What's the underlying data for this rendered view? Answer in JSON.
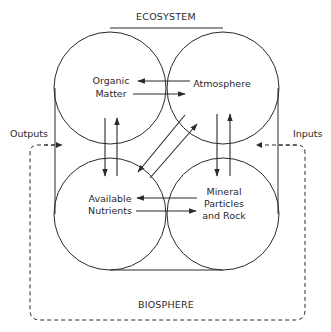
{
  "diagram": {
    "title_top": "ECOSYSTEM",
    "title_bottom": "BIOSPHERE",
    "outputs_label": "Outputs",
    "inputs_label": "Inputs",
    "nodes": [
      {
        "id": "organic-matter",
        "lines": [
          "Organic",
          "Matter"
        ]
      },
      {
        "id": "atmosphere",
        "lines": [
          "Atmosphere"
        ]
      },
      {
        "id": "available-nutrients",
        "lines": [
          "Available",
          "Nutrients"
        ]
      },
      {
        "id": "mineral-particles",
        "lines": [
          "Mineral",
          "Particles",
          "and  Rock"
        ]
      }
    ],
    "edges": [
      {
        "from": "atmosphere",
        "to": "organic-matter"
      },
      {
        "from": "organic-matter",
        "to": "atmosphere"
      },
      {
        "from": "mineral-particles",
        "to": "available-nutrients"
      },
      {
        "from": "available-nutrients",
        "to": "mineral-particles"
      },
      {
        "from": "organic-matter",
        "to": "available-nutrients"
      },
      {
        "from": "available-nutrients",
        "to": "organic-matter"
      },
      {
        "from": "atmosphere",
        "to": "mineral-particles"
      },
      {
        "from": "mineral-particles",
        "to": "atmosphere"
      },
      {
        "from": "atmosphere",
        "to": "available-nutrients"
      },
      {
        "from": "available-nutrients",
        "to": "atmosphere"
      },
      {
        "from": "biosphere",
        "to": "ecosystem",
        "label": "Inputs",
        "style": "dashed"
      },
      {
        "from": "ecosystem",
        "to": "biosphere",
        "label": "Outputs",
        "style": "dashed"
      }
    ],
    "colors": {
      "line": "#2a2a2a",
      "background": "#ffffff"
    }
  }
}
